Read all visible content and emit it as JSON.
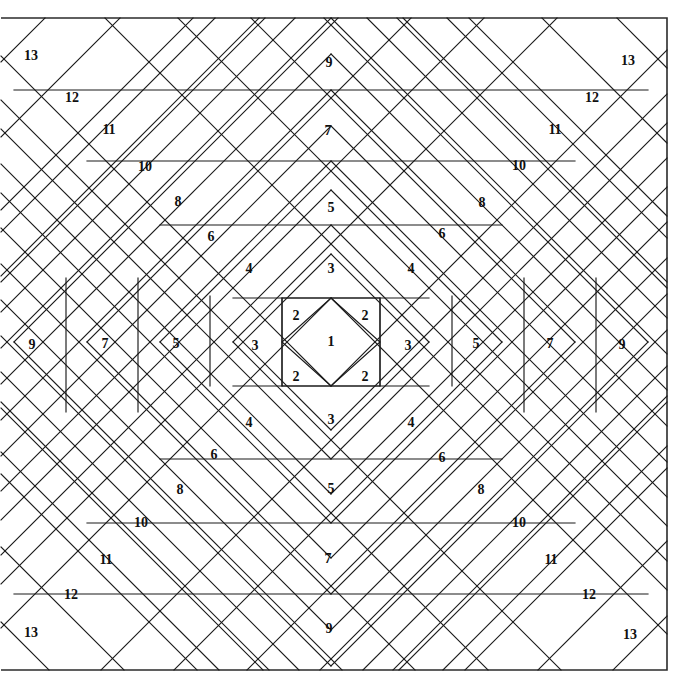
{
  "figure": {
    "kind": "geometric-tiling-diagram",
    "width": 698,
    "height": 698,
    "background_color": "#ffffff",
    "line_color": "#1a1a1a",
    "border_color": "#2b2b2b",
    "label_color": "#101010"
  },
  "frame": {
    "left": 1,
    "top": 18,
    "right": 667,
    "bottom": 670,
    "center_x": 331,
    "center_y": 342
  },
  "rings": [
    {
      "index": 1,
      "label": "1",
      "shape": "central-diamond",
      "half_width": 49,
      "half_height": 44
    },
    {
      "index": 2,
      "label": "2",
      "shape": "corner-triangles",
      "half_width": 49,
      "half_height": 44
    },
    {
      "index": 3,
      "label": "3",
      "shape": "ring",
      "half_width": 98,
      "half_height": 44
    },
    {
      "index": 4,
      "label": "4",
      "shape": "ring",
      "half_width": 98,
      "half_height": 88
    },
    {
      "index": 5,
      "label": "5",
      "shape": "ring",
      "half_width": 171,
      "half_height": 117
    },
    {
      "index": 6,
      "label": "6",
      "shape": "ring",
      "half_width": 171,
      "half_height": 152
    },
    {
      "index": 7,
      "label": "7",
      "shape": "ring",
      "half_width": 244,
      "half_height": 181
    },
    {
      "index": 8,
      "label": "8",
      "shape": "ring",
      "half_width": 244,
      "half_height": 216
    },
    {
      "index": 9,
      "label": "9",
      "shape": "ring",
      "half_width": 317,
      "half_height": 252
    },
    {
      "index": 10,
      "label": "10",
      "shape": "diagonal-band",
      "half_width": 317,
      "half_height": 288
    },
    {
      "index": 11,
      "label": "11",
      "shape": "diagonal-band",
      "half_width": 390,
      "half_height": 324
    },
    {
      "index": 12,
      "label": "12",
      "shape": "diagonal-band",
      "half_width": 462,
      "half_height": 360
    },
    {
      "index": 13,
      "label": "13",
      "shape": "corner-band",
      "half_width": 535,
      "half_height": 396
    }
  ],
  "labels": [
    {
      "text": "1",
      "x": 331,
      "y": 343,
      "region": "center-diamond"
    },
    {
      "text": "2",
      "x": 296,
      "y": 317,
      "region": "inner-corner-top-left"
    },
    {
      "text": "2",
      "x": 365,
      "y": 317,
      "region": "inner-corner-top-right"
    },
    {
      "text": "2",
      "x": 296,
      "y": 378,
      "region": "inner-corner-bottom-left"
    },
    {
      "text": "2",
      "x": 365,
      "y": 378,
      "region": "inner-corner-bottom-right"
    },
    {
      "text": "3",
      "x": 255,
      "y": 347,
      "region": "ring3-left"
    },
    {
      "text": "3",
      "x": 408,
      "y": 347,
      "region": "ring3-right"
    },
    {
      "text": "3",
      "x": 331,
      "y": 270,
      "region": "ring3-top"
    },
    {
      "text": "3",
      "x": 331,
      "y": 421,
      "region": "ring3-bottom"
    },
    {
      "text": "4",
      "x": 249,
      "y": 270,
      "region": "ring4-top-left"
    },
    {
      "text": "4",
      "x": 411,
      "y": 270,
      "region": "ring4-top-right"
    },
    {
      "text": "4",
      "x": 249,
      "y": 424,
      "region": "ring4-bottom-left"
    },
    {
      "text": "4",
      "x": 411,
      "y": 424,
      "region": "ring4-bottom-right"
    },
    {
      "text": "5",
      "x": 176,
      "y": 345,
      "region": "ring5-left"
    },
    {
      "text": "5",
      "x": 476,
      "y": 345,
      "region": "ring5-right"
    },
    {
      "text": "5",
      "x": 331,
      "y": 209,
      "region": "ring5-top"
    },
    {
      "text": "5",
      "x": 331,
      "y": 490,
      "region": "ring5-bottom"
    },
    {
      "text": "6",
      "x": 211,
      "y": 238,
      "region": "ring6-top-left"
    },
    {
      "text": "6",
      "x": 442,
      "y": 235,
      "region": "ring6-top-right"
    },
    {
      "text": "6",
      "x": 214,
      "y": 456,
      "region": "ring6-bottom-left"
    },
    {
      "text": "6",
      "x": 442,
      "y": 459,
      "region": "ring6-bottom-right"
    },
    {
      "text": "7",
      "x": 105,
      "y": 345,
      "region": "ring7-left"
    },
    {
      "text": "7",
      "x": 550,
      "y": 345,
      "region": "ring7-right"
    },
    {
      "text": "7",
      "x": 328,
      "y": 132,
      "region": "ring7-top"
    },
    {
      "text": "7",
      "x": 328,
      "y": 560,
      "region": "ring7-bottom"
    },
    {
      "text": "8",
      "x": 178,
      "y": 203,
      "region": "ring8-top-left"
    },
    {
      "text": "8",
      "x": 482,
      "y": 204,
      "region": "ring8-top-right"
    },
    {
      "text": "8",
      "x": 180,
      "y": 491,
      "region": "ring8-bottom-left"
    },
    {
      "text": "8",
      "x": 481,
      "y": 491,
      "region": "ring8-bottom-right"
    },
    {
      "text": "9",
      "x": 32,
      "y": 346,
      "region": "ring9-left"
    },
    {
      "text": "9",
      "x": 622,
      "y": 346,
      "region": "ring9-right"
    },
    {
      "text": "9",
      "x": 329,
      "y": 64,
      "region": "ring9-top"
    },
    {
      "text": "9",
      "x": 329,
      "y": 630,
      "region": "ring9-bottom"
    },
    {
      "text": "10",
      "x": 145,
      "y": 168,
      "region": "band10-top-left"
    },
    {
      "text": "10",
      "x": 519,
      "y": 167,
      "region": "band10-top-right"
    },
    {
      "text": "10",
      "x": 141,
      "y": 524,
      "region": "band10-bottom-left"
    },
    {
      "text": "10",
      "x": 519,
      "y": 524,
      "region": "band10-bottom-right"
    },
    {
      "text": "11",
      "x": 109,
      "y": 131,
      "region": "band11-top-left"
    },
    {
      "text": "11",
      "x": 555,
      "y": 131,
      "region": "band11-top-right"
    },
    {
      "text": "11",
      "x": 106,
      "y": 561,
      "region": "band11-bottom-left"
    },
    {
      "text": "11",
      "x": 551,
      "y": 561,
      "region": "band11-bottom-right"
    },
    {
      "text": "12",
      "x": 72,
      "y": 99,
      "region": "band12-top-left"
    },
    {
      "text": "12",
      "x": 592,
      "y": 99,
      "region": "band12-top-right"
    },
    {
      "text": "12",
      "x": 71,
      "y": 596,
      "region": "band12-bottom-left"
    },
    {
      "text": "12",
      "x": 589,
      "y": 596,
      "region": "band12-bottom-right"
    },
    {
      "text": "13",
      "x": 31,
      "y": 57,
      "region": "corner13-top-left"
    },
    {
      "text": "13",
      "x": 628,
      "y": 62,
      "region": "corner13-top-right"
    },
    {
      "text": "13",
      "x": 31,
      "y": 634,
      "region": "corner13-bottom-left"
    },
    {
      "text": "13",
      "x": 630,
      "y": 636,
      "region": "corner13-bottom-right"
    }
  ],
  "geometry": {
    "diagonals_note": "Diagonal lines at 45 degrees radiate from the four corners of each nested rectangle toward the frame edges.",
    "vertical_divider_x": [
      66,
      138,
      210,
      452,
      524,
      596
    ],
    "horizontal_divider_y": [
      90,
      161,
      232,
      452,
      523,
      595
    ]
  }
}
